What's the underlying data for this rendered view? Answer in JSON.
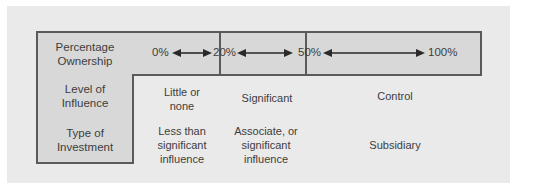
{
  "rows": [
    {
      "label": "Percentage Ownership",
      "label_lines": [
        "Percentage",
        "Ownership"
      ]
    },
    {
      "label": "Level of Influence",
      "label_lines": [
        "Level of",
        "Influence"
      ]
    },
    {
      "label": "Type of Investment",
      "label_lines": [
        "Type of",
        "Investment"
      ]
    }
  ],
  "ownership": {
    "markers": [
      "0%",
      "20%",
      "50%",
      "100%"
    ]
  },
  "influence": {
    "little": [
      "Little or",
      "none"
    ],
    "significant": [
      "Significant"
    ],
    "control": [
      "Control"
    ]
  },
  "investment": {
    "less": [
      "Less than",
      "significant",
      "influence"
    ],
    "associate": [
      "Associate, or",
      "significant",
      "influence"
    ],
    "subsidiary": [
      "Subsidiary"
    ]
  },
  "colors": {
    "panel": "#eaeaea",
    "cell_fill": "#d8d8d8",
    "border": "#5a5a5a",
    "text": "#3d3d3d"
  }
}
